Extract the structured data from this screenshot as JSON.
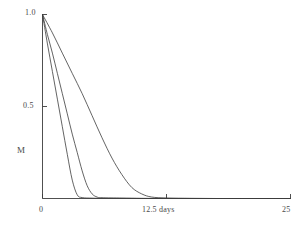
{
  "chart_data": {
    "type": "line",
    "title": "",
    "subtitle": "",
    "xlabel": "12.5 days",
    "ylabel": "M",
    "xlim": [
      0,
      25
    ],
    "ylim": [
      0,
      1.0
    ],
    "grid": false,
    "legend": "none",
    "x_tick_labels": [
      "0",
      "12.5 days",
      "25"
    ],
    "x_tick_values": [
      0,
      12.5,
      25
    ],
    "y_tick_labels": [
      "0.5",
      "1.0"
    ],
    "y_tick_values": [
      0.5,
      1.0
    ],
    "axis_color": "#3c3c3c",
    "line_color": "#3c3c3c",
    "background_color": "#ffffff",
    "series": [
      {
        "name": "fast decay",
        "decay_note": "steepest curve, reaches baseline near day 3.5",
        "x": [
          0,
          0.5,
          1.0,
          1.5,
          2.0,
          2.5,
          3.0,
          3.5,
          4.0,
          5.0,
          6.0,
          8.0,
          10.0,
          12.5,
          15.0,
          20.0,
          25.0
        ],
        "y": [
          1.0,
          0.84,
          0.69,
          0.54,
          0.39,
          0.24,
          0.1,
          0.02,
          0.005,
          0.002,
          0.001,
          0.001,
          0.0,
          0.0,
          0.0,
          0.0,
          0.0
        ]
      },
      {
        "name": "medium decay",
        "decay_note": "middle curve, reaches baseline near day 5.5",
        "x": [
          0,
          0.5,
          1.0,
          1.5,
          2.0,
          2.5,
          3.0,
          3.5,
          4.0,
          4.5,
          5.0,
          5.5,
          6.0,
          8.0,
          10.0,
          12.5,
          15.0,
          20.0,
          25.0
        ],
        "y": [
          1.0,
          0.89,
          0.79,
          0.68,
          0.57,
          0.46,
          0.35,
          0.25,
          0.15,
          0.07,
          0.025,
          0.008,
          0.004,
          0.002,
          0.001,
          0.0,
          0.0,
          0.0,
          0.0
        ]
      },
      {
        "name": "slow decay",
        "decay_note": "shallowest curve, reaches baseline near day 11",
        "x": [
          0,
          1.0,
          2.0,
          3.0,
          4.0,
          5.0,
          6.0,
          7.0,
          8.0,
          9.0,
          10.0,
          11.0,
          12.5,
          15.0,
          17.5,
          20.0,
          25.0
        ],
        "y": [
          1.0,
          0.9,
          0.79,
          0.68,
          0.57,
          0.45,
          0.33,
          0.22,
          0.13,
          0.06,
          0.025,
          0.008,
          0.003,
          0.001,
          0.0,
          0.0,
          0.0
        ]
      }
    ]
  },
  "labels": {
    "y_top": "1.0",
    "y_mid": "0.5",
    "y_axis_title": "M",
    "x_left": "0",
    "x_mid": "12.5 days",
    "x_right": "25"
  }
}
